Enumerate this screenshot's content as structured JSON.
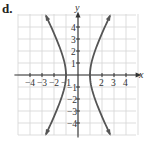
{
  "panel_label": "d.",
  "colors": {
    "grid": "#d4d4d4",
    "axis": "#333333",
    "curve": "#555555",
    "background": "#ffffff"
  },
  "chart_data": {
    "type": "line",
    "title": "",
    "panel": "d.",
    "xlabel": "x",
    "ylabel": "y",
    "xlim": [
      -5,
      5
    ],
    "ylim": [
      -5,
      5
    ],
    "grid": true,
    "legend": null,
    "x_ticks": [
      -4,
      -3,
      -2,
      -1,
      1,
      2,
      3,
      4
    ],
    "x_tick_labels": [
      "-4",
      "-3",
      "-2",
      "-1",
      "",
      "2",
      "3",
      "4"
    ],
    "y_ticks": [
      -4,
      -3,
      -2,
      -1,
      1,
      2,
      3,
      4
    ],
    "y_tick_labels": [
      "-4",
      "-3",
      "-2",
      "-1",
      "1",
      "2",
      "3",
      "4"
    ],
    "curve": {
      "description": "Hyperbola opening left and right with vertices at (-1, 0) and (1, 0)",
      "equation": "x^2 - y^2/4 = 1",
      "vertices": [
        [
          -1,
          0
        ],
        [
          1,
          0
        ]
      ],
      "arrows_at_ends": true
    },
    "series": [
      {
        "name": "left-branch",
        "x": [
          -2.69,
          -2.24,
          -1.8,
          -1.41,
          -1.12,
          -1.0,
          -1.12,
          -1.41,
          -1.8,
          -2.24,
          -2.69
        ],
        "y": [
          5,
          4,
          3,
          2,
          1,
          0,
          -1,
          -2,
          -3,
          -4,
          -5
        ]
      },
      {
        "name": "right-branch",
        "x": [
          2.69,
          2.24,
          1.8,
          1.41,
          1.12,
          1.0,
          1.12,
          1.41,
          1.8,
          2.24,
          2.69
        ],
        "y": [
          5,
          4,
          3,
          2,
          1,
          0,
          -1,
          -2,
          -3,
          -4,
          -5
        ]
      }
    ]
  }
}
